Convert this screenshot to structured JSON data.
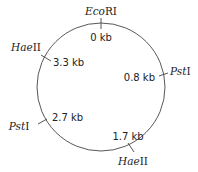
{
  "diagram": {
    "type": "plasmid-restriction-map",
    "circle": {
      "cx": 101,
      "cy": 87,
      "r": 64,
      "stroke": "#444444"
    },
    "sites": [
      {
        "enzyme_italic": "Eco",
        "enzyme_roman": "RI",
        "position": "0 kb"
      },
      {
        "enzyme_italic": "Pst",
        "enzyme_roman": "I",
        "position": "0.8 kb"
      },
      {
        "enzyme_italic": "Hae",
        "enzyme_roman": "II",
        "position": "1.7 kb"
      },
      {
        "enzyme_italic": "Pst",
        "enzyme_roman": "I",
        "position": "2.7 kb"
      },
      {
        "enzyme_italic": "Hae",
        "enzyme_roman": "II",
        "position": "3.3 kb"
      }
    ]
  }
}
